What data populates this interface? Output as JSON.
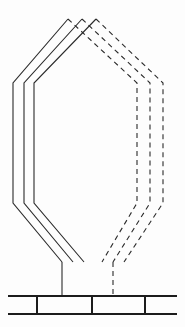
{
  "figure": {
    "type": "technical-line-drawing",
    "canvas": {
      "width": 185,
      "height": 327
    },
    "background_color": "#fdfdfd",
    "line_color": "#2b2b2b",
    "base_line_color": "#1c1c1c",
    "stroke_width": 1.1,
    "base_stroke_width": 2.0,
    "dash_pattern": "5 4",
    "solid_loop_half": {
      "name": "solid-left-half",
      "style": "solid",
      "turn_count": 3,
      "turns": [
        {
          "label": "turn-outer-solid",
          "points": "68,19 13,83 13,203 62,262"
        },
        {
          "label": "turn-middle-solid",
          "points": "82,19 24,83 24,203 73,262"
        },
        {
          "label": "turn-inner-solid",
          "points": "96,19 34,83 34,203 84,262"
        }
      ]
    },
    "dashed_loop_half": {
      "name": "dashed-right-half",
      "style": "dashed",
      "turn_count": 3,
      "turns": [
        {
          "label": "turn-outer-dashed",
          "points": "68,19 137,83 137,203 102,262"
        },
        {
          "label": "turn-middle-dashed",
          "points": "82,19 150,83 150,203 113,262"
        },
        {
          "label": "turn-inner-dashed",
          "points": "96,19 163,83 163,203 124,262"
        }
      ]
    },
    "stems": [
      {
        "label": "stem-solid-lead",
        "style": "solid",
        "x": 62,
        "y_top": 262,
        "y_bottom": 296
      },
      {
        "label": "stem-dashed-lead",
        "style": "dashed",
        "x": 113,
        "y_top": 262,
        "y_bottom": 296
      }
    ],
    "base": {
      "label": "segmented-base-rail",
      "x_left": 8,
      "x_right": 177,
      "y_top": 296,
      "y_bottom": 314,
      "rail_count": 2,
      "divider_x_positions": [
        37,
        92,
        145
      ],
      "divider_label": "base-divider"
    }
  }
}
